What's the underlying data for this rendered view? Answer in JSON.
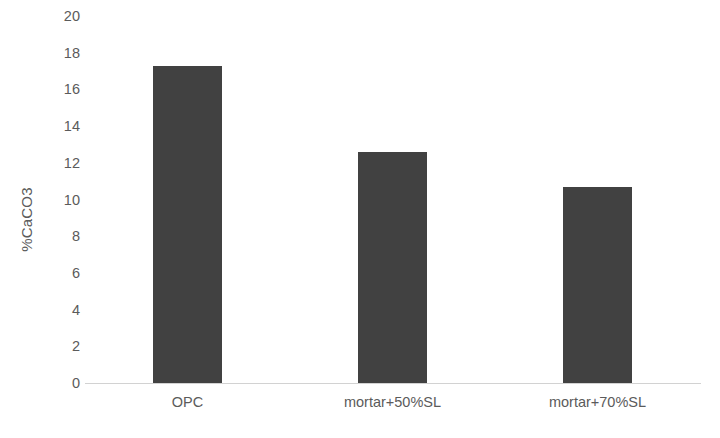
{
  "chart_data": {
    "type": "bar",
    "title": "",
    "subtitle": "",
    "xlabel": "",
    "ylabel": "%CaCO3",
    "categories": [
      "OPC",
      "mortar+50%SL",
      "mortar+70%SL"
    ],
    "values": [
      17.3,
      12.6,
      10.7
    ],
    "ylim": [
      0,
      20
    ],
    "ytick_step": 2,
    "ytick_labels": [
      "20",
      "18",
      "16",
      "14",
      "12",
      "10",
      "8",
      "6",
      "4",
      "2",
      "0"
    ],
    "ytick_values": [
      20,
      18,
      16,
      14,
      12,
      10,
      8,
      6,
      4,
      2,
      0
    ],
    "grid": false,
    "legend": false,
    "legend_position": "none",
    "bar_color": "#414141",
    "text_color": "#5b5b5b",
    "axis_line_color": "#d2d2d2",
    "background_color": "#ffffff"
  }
}
